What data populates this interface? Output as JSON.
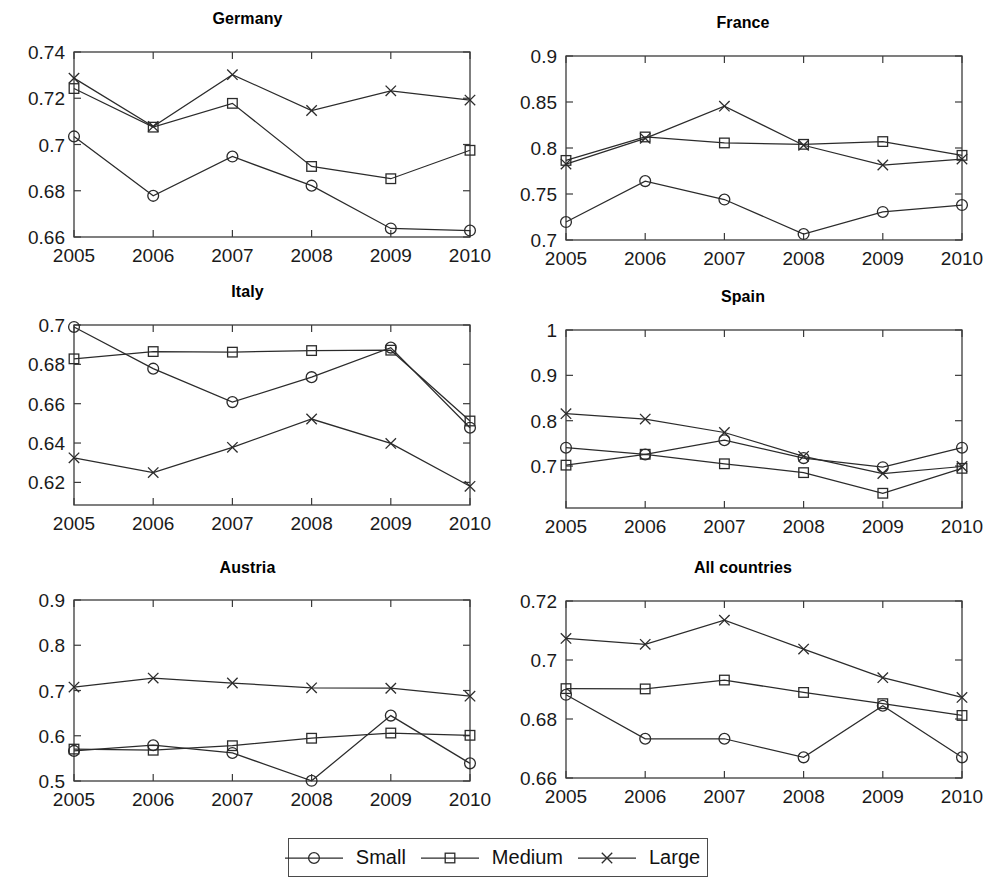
{
  "figure": {
    "legend": {
      "entries": [
        {
          "label": "Small",
          "marker": "circle-marker"
        },
        {
          "label": "Medium",
          "marker": "square-marker"
        },
        {
          "label": "Large",
          "marker": "cross-marker"
        }
      ]
    }
  },
  "chart_data": [
    {
      "type": "line",
      "title": "Germany",
      "xlabel": "",
      "ylabel": "",
      "x": [
        2005,
        2006,
        2007,
        2008,
        2009,
        2010
      ],
      "xtick_labels": [
        "2005",
        "2006",
        "2007",
        "2008",
        "2009",
        "2010"
      ],
      "xlim": [
        2005,
        2010
      ],
      "ylim": [
        0.66,
        0.74
      ],
      "ytick_labels": [
        "0.66",
        "0.68",
        "0.7",
        "0.72",
        "0.74"
      ],
      "yticks": [
        0.66,
        0.68,
        0.7,
        0.72,
        0.74
      ],
      "grid": false,
      "legend_position": "below-figure",
      "series": [
        {
          "name": "Small",
          "marker": "circle",
          "values": [
            0.7035,
            0.6778,
            0.6948,
            0.6822,
            0.6637,
            0.6628
          ]
        },
        {
          "name": "Medium",
          "marker": "square",
          "values": [
            0.7242,
            0.7075,
            0.7178,
            0.6905,
            0.6852,
            0.6975
          ]
        },
        {
          "name": "Large",
          "marker": "cross",
          "values": [
            0.7287,
            0.7078,
            0.7302,
            0.7147,
            0.7232,
            0.7192
          ]
        }
      ]
    },
    {
      "type": "line",
      "title": "France",
      "xlabel": "",
      "ylabel": "",
      "x": [
        2005,
        2006,
        2007,
        2008,
        2009,
        2010
      ],
      "xtick_labels": [
        "2005",
        "2006",
        "2007",
        "2008",
        "2009",
        "2010"
      ],
      "xlim": [
        2005,
        2010
      ],
      "ylim": [
        0.7,
        0.9
      ],
      "ytick_labels": [
        "0.7",
        "0.75",
        "0.8",
        "0.85",
        "0.9"
      ],
      "yticks": [
        0.7,
        0.75,
        0.8,
        0.85,
        0.9
      ],
      "grid": false,
      "legend_position": "below-figure",
      "series": [
        {
          "name": "Small",
          "marker": "circle",
          "values": [
            0.7195,
            0.764,
            0.744,
            0.7065,
            0.7305,
            0.738
          ]
        },
        {
          "name": "Medium",
          "marker": "square",
          "values": [
            0.7865,
            0.812,
            0.8055,
            0.804,
            0.807,
            0.792
          ]
        },
        {
          "name": "Large",
          "marker": "cross",
          "values": [
            0.7825,
            0.8105,
            0.8455,
            0.803,
            0.7815,
            0.788
          ]
        }
      ]
    },
    {
      "type": "line",
      "title": "Italy",
      "xlabel": "",
      "ylabel": "",
      "x": [
        2005,
        2006,
        2007,
        2008,
        2009,
        2010
      ],
      "xtick_labels": [
        "2005",
        "2006",
        "2007",
        "2008",
        "2009",
        "2010"
      ],
      "xlim": [
        2005,
        2010
      ],
      "ylim": [
        0.6085,
        0.7
      ],
      "ytick_labels": [
        "0.62",
        "0.64",
        "0.66",
        "0.68",
        "0.7"
      ],
      "yticks": [
        0.62,
        0.64,
        0.66,
        0.68,
        0.7
      ],
      "grid": false,
      "legend_position": "below-figure",
      "series": [
        {
          "name": "Small",
          "marker": "circle",
          "values": [
            0.699,
            0.6778,
            0.6608,
            0.6735,
            0.6885,
            0.6478
          ]
        },
        {
          "name": "Medium",
          "marker": "square",
          "values": [
            0.6828,
            0.6865,
            0.6862,
            0.687,
            0.6872,
            0.6512
          ]
        },
        {
          "name": "Large",
          "marker": "cross",
          "values": [
            0.6325,
            0.625,
            0.6378,
            0.6522,
            0.6398,
            0.618
          ]
        }
      ]
    },
    {
      "type": "line",
      "title": "Spain",
      "xlabel": "",
      "ylabel": "",
      "x": [
        2005,
        2006,
        2007,
        2008,
        2009,
        2010
      ],
      "xtick_labels": [
        "2005",
        "2006",
        "2007",
        "2008",
        "2009",
        "2010"
      ],
      "xlim": [
        2005,
        2010
      ],
      "ylim": [
        0.6075,
        1.0
      ],
      "ytick_labels": [
        "0.7",
        "0.8",
        "0.9",
        "1"
      ],
      "yticks": [
        0.7,
        0.8,
        0.9,
        1.0
      ],
      "grid": false,
      "legend_position": "below-figure",
      "series": [
        {
          "name": "Small",
          "marker": "circle",
          "values": [
            0.7405,
            0.7255,
            0.757,
            0.7175,
            0.6975,
            0.7405
          ]
        },
        {
          "name": "Medium",
          "marker": "square",
          "values": [
            0.702,
            0.726,
            0.705,
            0.6855,
            0.64,
            0.695
          ]
        },
        {
          "name": "Large",
          "marker": "cross",
          "values": [
            0.8155,
            0.8035,
            0.774,
            0.7215,
            0.6835,
            0.699
          ]
        }
      ]
    },
    {
      "type": "line",
      "title": "Austria",
      "xlabel": "",
      "ylabel": "",
      "x": [
        2005,
        2006,
        2007,
        2008,
        2009,
        2010
      ],
      "xtick_labels": [
        "2005",
        "2006",
        "2007",
        "2008",
        "2009",
        "2010"
      ],
      "xlim": [
        2005,
        2010
      ],
      "ylim": [
        0.5,
        0.9
      ],
      "ytick_labels": [
        "0.5",
        "0.6",
        "0.7",
        "0.8",
        "0.9"
      ],
      "yticks": [
        0.5,
        0.6,
        0.7,
        0.8,
        0.9
      ],
      "grid": false,
      "legend_position": "below-figure",
      "series": [
        {
          "name": "Small",
          "marker": "circle",
          "values": [
            0.5665,
            0.579,
            0.562,
            0.5005,
            0.6445,
            0.539
          ]
        },
        {
          "name": "Medium",
          "marker": "square",
          "values": [
            0.5705,
            0.568,
            0.578,
            0.5945,
            0.606,
            0.601
          ]
        },
        {
          "name": "Large",
          "marker": "cross",
          "values": [
            0.7075,
            0.7275,
            0.7165,
            0.706,
            0.705,
            0.6875
          ]
        }
      ]
    },
    {
      "type": "line",
      "title": "All countries",
      "xlabel": "",
      "ylabel": "",
      "x": [
        2005,
        2006,
        2007,
        2008,
        2009,
        2010
      ],
      "xtick_labels": [
        "2005",
        "2006",
        "2007",
        "2008",
        "2009",
        "2010"
      ],
      "xlim": [
        2005,
        2010
      ],
      "ylim": [
        0.66,
        0.72
      ],
      "ytick_labels": [
        "0.66",
        "0.68",
        "0.7",
        "0.72"
      ],
      "yticks": [
        0.66,
        0.68,
        0.7,
        0.72
      ],
      "grid": false,
      "legend_position": "below-figure",
      "series": [
        {
          "name": "Small",
          "marker": "circle",
          "values": [
            0.6882,
            0.6733,
            0.6733,
            0.667,
            0.6845,
            0.667
          ]
        },
        {
          "name": "Medium",
          "marker": "square",
          "values": [
            0.6903,
            0.6902,
            0.6932,
            0.689,
            0.6852,
            0.6812
          ]
        },
        {
          "name": "Large",
          "marker": "cross",
          "values": [
            0.7073,
            0.7053,
            0.7135,
            0.7037,
            0.694,
            0.6873
          ]
        }
      ]
    }
  ]
}
